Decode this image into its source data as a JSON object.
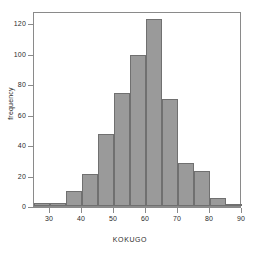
{
  "chart_data": {
    "type": "bar",
    "title": "",
    "subtitle": "",
    "xlabel": "KOKUGO",
    "ylabel": "frequency",
    "xlim": [
      25,
      90
    ],
    "ylim": [
      0,
      128
    ],
    "grid": false,
    "legend": null,
    "bin_width": 5,
    "bin_edges": [
      25,
      30,
      35,
      40,
      45,
      50,
      55,
      60,
      65,
      70,
      75,
      80,
      85,
      90
    ],
    "categories": [
      "25-30",
      "30-35",
      "35-40",
      "40-45",
      "45-50",
      "50-55",
      "55-60",
      "60-65",
      "65-70",
      "70-75",
      "75-80",
      "80-85",
      "85-90"
    ],
    "values": [
      2,
      2,
      10,
      21,
      47,
      74,
      99,
      123,
      70,
      28,
      23,
      5,
      1
    ],
    "xticks": [
      30,
      40,
      50,
      60,
      70,
      80,
      90
    ],
    "yticks": [
      0,
      20,
      40,
      60,
      80,
      100,
      120
    ],
    "bar_color": "#9a9a9a",
    "bar_border_color": "#707070",
    "axis_color": "#8a8a8a",
    "text_color": "#2b2b2b",
    "background": "#ffffff"
  },
  "axes": {
    "y_title": "frequency",
    "x_title": "KOKUGO",
    "y_tick_labels": [
      "0",
      "20",
      "40",
      "60",
      "80",
      "100",
      "120"
    ],
    "x_tick_labels": [
      "30",
      "40",
      "50",
      "60",
      "70",
      "80",
      "90"
    ]
  }
}
